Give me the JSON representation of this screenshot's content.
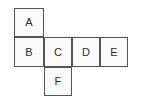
{
  "figure": {
    "kind": "cube-net-diagram",
    "background_color": "#ffffff",
    "cell_fill_color": "#fbfbfb",
    "cell_border_color": "#555555",
    "label_color": "#2b2b2b",
    "rows": [
      {
        "row_index": 1,
        "cells": [
          {
            "label": "A",
            "column": 1
          }
        ]
      },
      {
        "row_index": 2,
        "cells": [
          {
            "label": "B",
            "column": 1
          },
          {
            "label": "C",
            "column": 2
          },
          {
            "label": "D",
            "column": 3
          },
          {
            "label": "E",
            "column": 4
          }
        ]
      },
      {
        "row_index": 3,
        "cells": [
          {
            "label": "F",
            "column": 2
          }
        ]
      }
    ]
  }
}
